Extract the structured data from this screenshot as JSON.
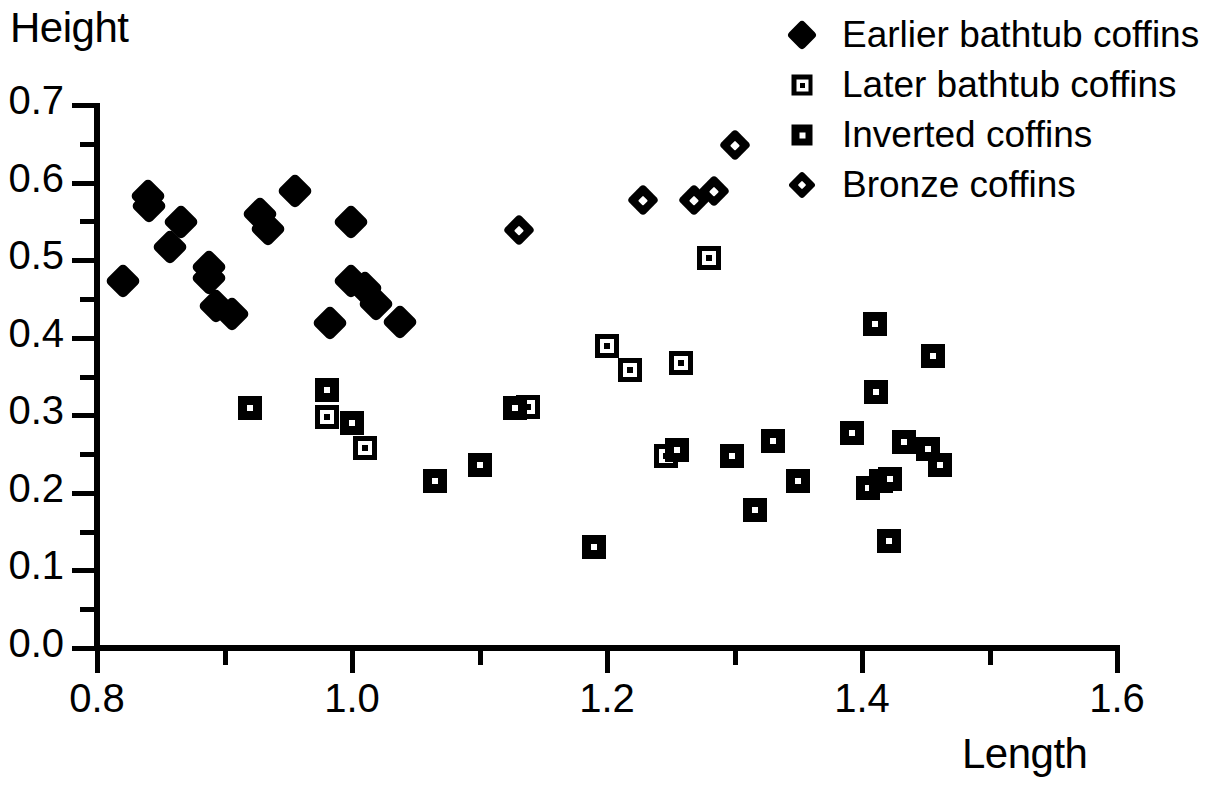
{
  "chart_data": {
    "type": "scatter",
    "title": "",
    "xlabel": "Length",
    "ylabel": "Height",
    "xlim": [
      0.8,
      1.6
    ],
    "ylim": [
      0.0,
      0.7
    ],
    "x_ticks": [
      "0.8",
      "1.0",
      "1.2",
      "1.4",
      "1.6"
    ],
    "x_tick_values": [
      0.8,
      1.0,
      1.2,
      1.4,
      1.6
    ],
    "x_minor_tick_values": [
      0.9,
      1.1,
      1.3,
      1.5
    ],
    "y_ticks": [
      "0.0",
      "0.1",
      "0.2",
      "0.3",
      "0.4",
      "0.5",
      "0.6",
      "0.7"
    ],
    "y_tick_values": [
      0.0,
      0.1,
      0.2,
      0.3,
      0.4,
      0.5,
      0.6,
      0.7
    ],
    "y_minor_tick_values": [
      0.05,
      0.15,
      0.25,
      0.35,
      0.45,
      0.55,
      0.65
    ],
    "grid": false,
    "legend_position": "top-right",
    "series": [
      {
        "name": "Earlier bathtub coffins",
        "marker": "filled-diamond",
        "color": "#000000",
        "points": [
          [
            0.82,
            0.473
          ],
          [
            0.84,
            0.583
          ],
          [
            0.841,
            0.57
          ],
          [
            0.857,
            0.517
          ],
          [
            0.866,
            0.549
          ],
          [
            0.888,
            0.491
          ],
          [
            0.888,
            0.477
          ],
          [
            0.893,
            0.441
          ],
          [
            0.906,
            0.43
          ],
          [
            0.928,
            0.56
          ],
          [
            0.934,
            0.54
          ],
          [
            0.955,
            0.589
          ],
          [
            0.983,
            0.419
          ],
          [
            0.999,
            0.549
          ],
          [
            0.999,
            0.473
          ],
          [
            1.01,
            0.464
          ],
          [
            1.019,
            0.443
          ],
          [
            1.038,
            0.42
          ]
        ]
      },
      {
        "name": "Later bathtub coffins",
        "marker": "open-square",
        "color": "#000000",
        "points": [
          [
            0.98,
            0.298
          ],
          [
            1.01,
            0.258
          ],
          [
            1.138,
            0.311
          ],
          [
            1.2,
            0.389
          ],
          [
            1.218,
            0.358
          ],
          [
            1.258,
            0.368
          ],
          [
            1.246,
            0.247
          ],
          [
            1.28,
            0.503
          ]
        ]
      },
      {
        "name": "Inverted coffins",
        "marker": "filled-square",
        "color": "#000000",
        "points": [
          [
            0.92,
            0.31
          ],
          [
            0.98,
            0.333
          ],
          [
            1.0,
            0.29
          ],
          [
            1.065,
            0.215
          ],
          [
            1.1,
            0.236
          ],
          [
            1.128,
            0.31
          ],
          [
            1.19,
            0.13
          ],
          [
            1.255,
            0.255
          ],
          [
            1.298,
            0.247
          ],
          [
            1.316,
            0.178
          ],
          [
            1.33,
            0.267
          ],
          [
            1.35,
            0.215
          ],
          [
            1.392,
            0.277
          ],
          [
            1.405,
            0.206
          ],
          [
            1.41,
            0.418
          ],
          [
            1.411,
            0.33
          ],
          [
            1.415,
            0.215
          ],
          [
            1.422,
            0.218
          ],
          [
            1.421,
            0.138
          ],
          [
            1.433,
            0.265
          ],
          [
            1.452,
            0.256
          ],
          [
            1.456,
            0.376
          ],
          [
            1.461,
            0.236
          ]
        ]
      },
      {
        "name": "Bronze coffins",
        "marker": "dotted-diamond",
        "color": "#000000",
        "points": [
          [
            1.131,
            0.539
          ],
          [
            1.228,
            0.578
          ],
          [
            1.268,
            0.577
          ],
          [
            1.284,
            0.589
          ],
          [
            1.3,
            0.648
          ]
        ]
      }
    ]
  },
  "legend": {
    "items": [
      {
        "label": "Earlier bathtub coffins",
        "marker": "filled-diamond"
      },
      {
        "label": "Later bathtub coffins",
        "marker": "open-square"
      },
      {
        "label": "Inverted coffins",
        "marker": "filled-square"
      },
      {
        "label": "Bronze coffins",
        "marker": "dotted-diamond"
      }
    ]
  },
  "axes": {
    "y_title": "Height",
    "x_title": "Length"
  }
}
